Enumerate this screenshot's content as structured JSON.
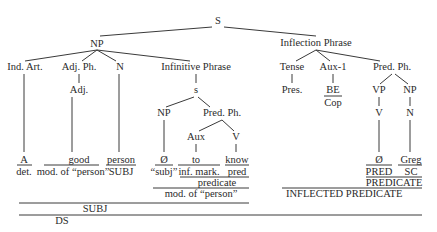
{
  "diagram": {
    "type": "syntax-tree",
    "nodes": {
      "S": {
        "label": "S",
        "x": 218,
        "y": 23
      },
      "NP": {
        "label": "NP",
        "x": 97,
        "y": 47
      },
      "IndArt": {
        "label": "Ind. Art.",
        "x": 25,
        "y": 70
      },
      "AdjPh": {
        "label": "Adj. Ph.",
        "x": 79,
        "y": 70
      },
      "N1": {
        "label": "N",
        "x": 120,
        "y": 70
      },
      "InfPh": {
        "label": "Infinitive Phrase",
        "x": 196,
        "y": 70
      },
      "Adj": {
        "label": "Adj.",
        "x": 79,
        "y": 93
      },
      "s": {
        "label": "s",
        "x": 196,
        "y": 93
      },
      "NP2": {
        "label": "NP",
        "x": 164,
        "y": 116
      },
      "PredPh1": {
        "label": "Pred. Ph.",
        "x": 222,
        "y": 116
      },
      "Aux": {
        "label": "Aux",
        "x": 196,
        "y": 140
      },
      "V1": {
        "label": "V",
        "x": 236,
        "y": 140
      },
      "InflPh": {
        "label": "Inflection Phrase",
        "x": 316,
        "y": 46
      },
      "Tense": {
        "label": "Tense",
        "x": 292,
        "y": 70
      },
      "Aux1": {
        "label": "Aux-1",
        "x": 333,
        "y": 70
      },
      "PredPh2": {
        "label": "Pred. Ph.",
        "x": 400,
        "y": 70
      },
      "Pres": {
        "label": "Pres.",
        "x": 292,
        "y": 93
      },
      "BE": {
        "label": "BE",
        "x": 333,
        "y": 93
      },
      "Cop": {
        "label": "Cop",
        "x": 333,
        "y": 107
      },
      "VP": {
        "label": "VP",
        "x": 379,
        "y": 93
      },
      "NP3": {
        "label": "NP",
        "x": 410,
        "y": 93
      },
      "V2": {
        "label": "V",
        "x": 379,
        "y": 116
      },
      "N2": {
        "label": "N",
        "x": 410,
        "y": 116
      }
    },
    "leaves": [
      {
        "word": "A",
        "role": "det.",
        "x": 24
      },
      {
        "word": "good",
        "role": "mod. of “person”",
        "x": 79
      },
      {
        "word": "person",
        "role": "SUBJ",
        "x": 120
      },
      {
        "word": "Ø",
        "role": "“subj”",
        "x": 164
      },
      {
        "word": "to",
        "role": "inf. mark.",
        "x": 196
      },
      {
        "word": "know",
        "role": "pred",
        "x": 236
      },
      {
        "word": "Ø",
        "role": "PRED",
        "x": 379
      },
      {
        "word": "Greg",
        "role": "SC",
        "x": 410
      }
    ],
    "spans": {
      "predicate": "predicate",
      "mod_person": "mod. of “person”",
      "PREDICATE": "PREDICATE",
      "INFLECTED_PREDICATE": "INFLECTED PREDICATE",
      "SUBJ": "SUBJ",
      "DS": "DS"
    }
  }
}
